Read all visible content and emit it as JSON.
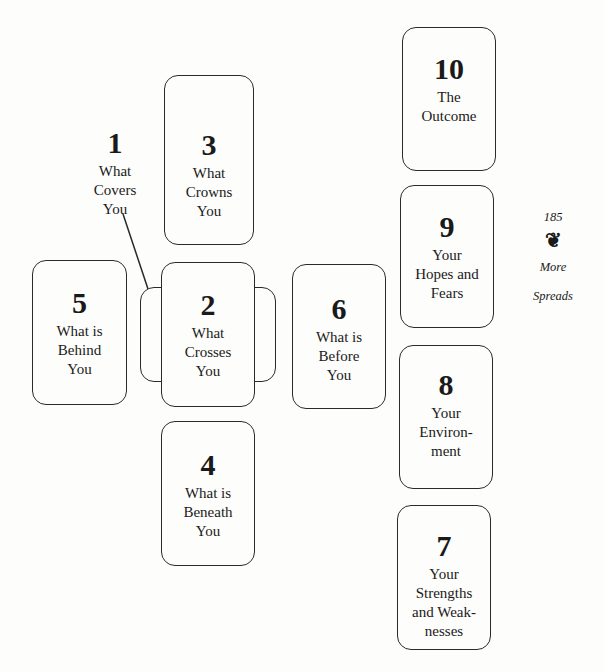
{
  "page": {
    "number": "185",
    "ornament": "❦",
    "section_line1": "More",
    "section_line2": "Spreads"
  },
  "cards": [
    {
      "position": "1",
      "label": "What\nCovers\nYou"
    },
    {
      "position": "2",
      "label": "What\nCrosses\nYou"
    },
    {
      "position": "3",
      "label": "What\nCrowns\nYou"
    },
    {
      "position": "4",
      "label": "What is\nBeneath\nYou"
    },
    {
      "position": "5",
      "label": "What is\nBehind\nYou"
    },
    {
      "position": "6",
      "label": "What is\nBefore\nYou"
    },
    {
      "position": "7",
      "label": "Your\nStrengths\nand Weak-\nnesses"
    },
    {
      "position": "8",
      "label": "Your\nEnviron-\nment"
    },
    {
      "position": "9",
      "label": "Your\nHopes and\nFears"
    },
    {
      "position": "10",
      "label": "The\nOutcome"
    }
  ]
}
